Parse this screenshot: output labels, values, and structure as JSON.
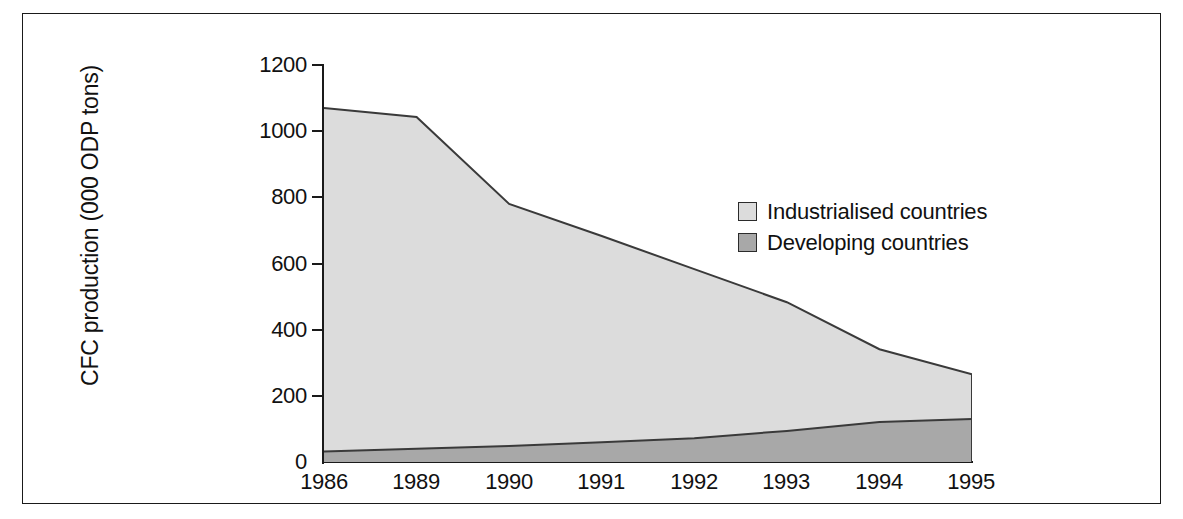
{
  "chart_data": {
    "type": "area",
    "title": "",
    "subtitle": "",
    "xlabel": "",
    "ylabel": "CFC production (000 ODP tons)",
    "categories": [
      "1986",
      "1989",
      "1990",
      "1991",
      "1992",
      "1993",
      "1994",
      "1995"
    ],
    "x": [
      "1986",
      "1989",
      "1990",
      "1991",
      "1992",
      "1993",
      "1994",
      "1995"
    ],
    "stacked": true,
    "series": [
      {
        "name": "Developing countries",
        "color": "#a8a8a8",
        "values": [
          32,
          40,
          48,
          60,
          72,
          94,
          121,
          130
        ]
      },
      {
        "name": "Industrialised countries",
        "color": "#dcdcdc",
        "values": [
          1038,
          1003,
          732,
          623,
          511,
          389,
          220,
          135
        ]
      }
    ],
    "totals": [
      1070,
      1043,
      780,
      683,
      583,
      483,
      341,
      265
    ],
    "ylim": [
      0,
      1200
    ],
    "yticks": [
      0,
      200,
      400,
      600,
      800,
      1000,
      1200
    ],
    "ytick_labels": [
      "0",
      "200",
      "400",
      "600",
      "800",
      "1000",
      "1200"
    ],
    "grid": false,
    "legend_position": "inside-upper-right",
    "legend": [
      {
        "label": "Industrialised countries",
        "color": "#dcdcdc"
      },
      {
        "label": "Developing countries",
        "color": "#a8a8a8"
      }
    ],
    "axis_color": "#1a1a1a",
    "line_color": "#3a3a3a",
    "background": "#ffffff"
  }
}
